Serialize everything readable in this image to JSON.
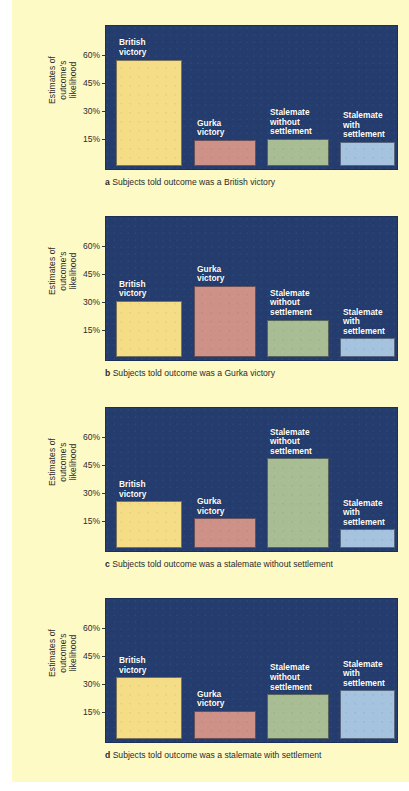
{
  "figure": {
    "background_color": "#fdfac6",
    "panel_color": "#253d6e",
    "ylabel": "Estimates of\noutcome's\nlikelihood",
    "tick_labels": [
      "60%",
      "45%",
      "30%",
      "15%"
    ],
    "tick_values": [
      60,
      45,
      30,
      15
    ],
    "bar_colors": {
      "british_victory": "#f4dd86",
      "gurka_victory": "#cd9188",
      "stalemate_without_settlement": "#a9bd95",
      "stalemate_with_settlement": "#a5c2de"
    },
    "bar_labels": [
      "British\nvictory",
      "Gurka\nvictory",
      "Stalemate\nwithout\nsettlement",
      "Stalemate\nwith\nsettlement"
    ],
    "captions": [
      {
        "letter": "a",
        "text": " Subjects told outcome was a British victory"
      },
      {
        "letter": "b",
        "text": " Subjects told outcome was a Gurka victory"
      },
      {
        "letter": "c",
        "text": " Subjects told outcome was a stalemate without settlement"
      },
      {
        "letter": "d",
        "text": " Subjects told outcome was a stalemate with settlement"
      }
    ]
  },
  "chart_data": [
    {
      "type": "bar",
      "panel": "a",
      "title": "a Subjects told outcome was a British victory",
      "categories": [
        "British victory",
        "Gurka victory",
        "Stalemate without settlement",
        "Stalemate with settlement"
      ],
      "values": [
        57,
        14,
        14.5,
        13
      ],
      "colors": [
        "#f4dd86",
        "#cd9188",
        "#a9bd95",
        "#a5c2de"
      ],
      "xlabel": "",
      "ylabel": "Estimates of outcome's likelihood",
      "ylim": [
        0,
        75
      ],
      "yticks": [
        15,
        30,
        45,
        60
      ],
      "ytick_labels": [
        "15%",
        "30%",
        "45%",
        "60%"
      ],
      "grid": false,
      "legend": "none"
    },
    {
      "type": "bar",
      "panel": "b",
      "title": "b Subjects told outcome was a Gurka victory",
      "categories": [
        "British victory",
        "Gurka victory",
        "Stalemate without settlement",
        "Stalemate with settlement"
      ],
      "values": [
        30,
        38,
        20,
        10
      ],
      "colors": [
        "#f4dd86",
        "#cd9188",
        "#a9bd95",
        "#a5c2de"
      ],
      "xlabel": "",
      "ylabel": "Estimates of outcome's likelihood",
      "ylim": [
        0,
        75
      ],
      "yticks": [
        15,
        30,
        45,
        60
      ],
      "ytick_labels": [
        "15%",
        "30%",
        "45%",
        "60%"
      ],
      "grid": false,
      "legend": "none"
    },
    {
      "type": "bar",
      "panel": "c",
      "title": "c Subjects told outcome was a stalemate without settlement",
      "categories": [
        "British victory",
        "Gurka victory",
        "Stalemate without settlement",
        "Stalemate with settlement"
      ],
      "values": [
        25,
        16,
        48,
        10
      ],
      "colors": [
        "#f4dd86",
        "#cd9188",
        "#a9bd95",
        "#a5c2de"
      ],
      "xlabel": "",
      "ylabel": "Estimates of outcome's likelihood",
      "ylim": [
        0,
        75
      ],
      "yticks": [
        15,
        30,
        45,
        60
      ],
      "ytick_labels": [
        "15%",
        "30%",
        "45%",
        "60%"
      ],
      "grid": false,
      "legend": "none"
    },
    {
      "type": "bar",
      "panel": "d",
      "title": "d Subjects told outcome was a stalemate with settlement",
      "categories": [
        "British victory",
        "Gurka victory",
        "Stalemate without settlement",
        "Stalemate with settlement"
      ],
      "values": [
        33,
        15,
        24,
        26
      ],
      "colors": [
        "#f4dd86",
        "#cd9188",
        "#a9bd95",
        "#a5c2de"
      ],
      "xlabel": "",
      "ylabel": "Estimates of outcome's likelihood",
      "ylim": [
        0,
        75
      ],
      "yticks": [
        15,
        30,
        45,
        60
      ],
      "ytick_labels": [
        "15%",
        "30%",
        "45%",
        "60%"
      ],
      "grid": false,
      "legend": "none"
    }
  ]
}
